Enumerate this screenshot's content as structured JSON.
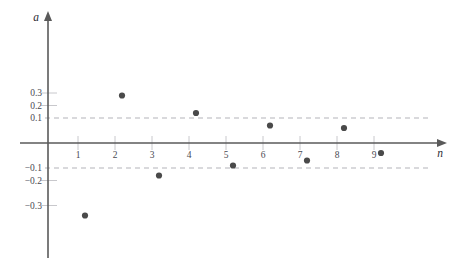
{
  "chart_data": {
    "type": "scatter",
    "title": "",
    "subtitle": "",
    "xlabel": "n",
    "ylabel": "a",
    "x": [
      1,
      2,
      3,
      4,
      5,
      6,
      7,
      8,
      9
    ],
    "values": [
      -0.29,
      0.19,
      -0.13,
      0.12,
      -0.09,
      0.07,
      -0.07,
      0.06,
      -0.04
    ],
    "series": [
      {
        "name": "a_n",
        "x": [
          1,
          2,
          3,
          4,
          5,
          6,
          7,
          8,
          9
        ],
        "values": [
          -0.29,
          0.19,
          -0.13,
          0.12,
          -0.09,
          0.07,
          -0.07,
          0.06,
          -0.04
        ]
      }
    ],
    "xlim": [
      0,
      10
    ],
    "ylim": [
      -0.4,
      0.38
    ],
    "grid": false,
    "legend": "none",
    "marker_color": "#4a4a4a",
    "axis_color": "#5a5a5a",
    "reference_lines": [
      {
        "name": "upper-band",
        "value": 0.1,
        "style": "dashed",
        "color": "#b4b4ba"
      },
      {
        "name": "lower-band",
        "value": -0.1,
        "style": "dashed",
        "color": "#b4b4ba"
      }
    ],
    "x_ticks": [
      {
        "value": 1,
        "label": "1"
      },
      {
        "value": 2,
        "label": "2"
      },
      {
        "value": 3,
        "label": "3"
      },
      {
        "value": 4,
        "label": "4"
      },
      {
        "value": 5,
        "label": "5"
      },
      {
        "value": 6,
        "label": "6"
      },
      {
        "value": 7,
        "label": "7"
      },
      {
        "value": 8,
        "label": "8"
      },
      {
        "value": 9,
        "label": "9"
      }
    ],
    "y_ticks": [
      {
        "value": 0.3,
        "label": "0.3"
      },
      {
        "value": 0.2,
        "label": "0.2"
      },
      {
        "value": 0.1,
        "label": "0.1"
      },
      {
        "value": -0.1,
        "label": "−0.1"
      },
      {
        "value": -0.2,
        "label": "−0.2"
      },
      {
        "value": -0.3,
        "label": "−0.3"
      }
    ]
  }
}
